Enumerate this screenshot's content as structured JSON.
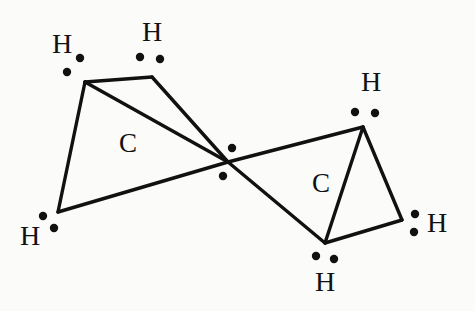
{
  "figure": {
    "background_color": "#fbfbfa",
    "ink_color": "#111111",
    "molecule_formula": "C2H4"
  },
  "atoms": {
    "carbons": [
      {
        "id": "carbon-left",
        "label": "C",
        "x": 128,
        "y": 146
      },
      {
        "id": "carbon-right",
        "label": "C",
        "x": 321,
        "y": 186
      }
    ],
    "hydrogens": [
      {
        "id": "hydrogen-top-left",
        "label": "H",
        "x": 62,
        "y": 47
      },
      {
        "id": "hydrogen-top-middle",
        "label": "H",
        "x": 152,
        "y": 35
      },
      {
        "id": "hydrogen-bottom-left",
        "label": "H",
        "x": 30,
        "y": 239
      },
      {
        "id": "hydrogen-top-right",
        "label": "H",
        "x": 371,
        "y": 85
      },
      {
        "id": "hydrogen-right",
        "label": "H",
        "x": 437,
        "y": 226
      },
      {
        "id": "hydrogen-bottom-middle",
        "label": "H",
        "x": 325,
        "y": 285
      }
    ]
  },
  "vertices": {
    "top_left": {
      "x": 85,
      "y": 82
    },
    "top_middle": {
      "x": 152,
      "y": 77
    },
    "bottom_left": {
      "x": 58,
      "y": 212
    },
    "center": {
      "x": 228,
      "y": 162
    },
    "top_right": {
      "x": 363,
      "y": 127
    },
    "right": {
      "x": 402,
      "y": 220
    },
    "bottom_middle": {
      "x": 325,
      "y": 243
    }
  },
  "bonds": [
    {
      "id": "bond-topleft-topmiddle",
      "from": "top_left",
      "to": "top_middle"
    },
    {
      "id": "bond-topleft-bottomleft",
      "from": "top_left",
      "to": "bottom_left"
    },
    {
      "id": "bond-topleft-center",
      "from": "top_left",
      "to": "center"
    },
    {
      "id": "bond-topmiddle-center",
      "from": "top_middle",
      "to": "center"
    },
    {
      "id": "bond-bottomleft-center",
      "from": "bottom_left",
      "to": "center"
    },
    {
      "id": "bond-center-topright",
      "from": "center",
      "to": "top_right"
    },
    {
      "id": "bond-center-bottommiddle",
      "from": "center",
      "to": "bottom_middle"
    },
    {
      "id": "bond-topright-right",
      "from": "top_right",
      "to": "right"
    },
    {
      "id": "bond-topright-bottommiddle",
      "from": "top_right",
      "to": "bottom_middle"
    },
    {
      "id": "bond-right-bottommiddle",
      "from": "right",
      "to": "bottom_middle"
    }
  ],
  "electron_dots": [
    {
      "id": "dot-center-upper",
      "x": 232,
      "y": 148,
      "r": 4.2,
      "group": "double-bond-pair"
    },
    {
      "id": "dot-center-lower",
      "x": 223,
      "y": 176,
      "r": 4.2,
      "group": "double-bond-pair"
    },
    {
      "id": "dot-topleft-a",
      "x": 80,
      "y": 58,
      "r": 4.2,
      "group": "hydrogen-top-left"
    },
    {
      "id": "dot-topleft-b",
      "x": 67,
      "y": 72,
      "r": 4.2,
      "group": "hydrogen-top-left"
    },
    {
      "id": "dot-topmiddle-a",
      "x": 140,
      "y": 57,
      "r": 4.2,
      "group": "hydrogen-top-middle"
    },
    {
      "id": "dot-topmiddle-b",
      "x": 160,
      "y": 59,
      "r": 4.2,
      "group": "hydrogen-top-middle"
    },
    {
      "id": "dot-bottomleft-a",
      "x": 43,
      "y": 216,
      "r": 4.2,
      "group": "hydrogen-bottom-left"
    },
    {
      "id": "dot-bottomleft-b",
      "x": 54,
      "y": 228,
      "r": 4.2,
      "group": "hydrogen-bottom-left"
    },
    {
      "id": "dot-topright-a",
      "x": 355,
      "y": 112,
      "r": 4.2,
      "group": "hydrogen-top-right"
    },
    {
      "id": "dot-topright-b",
      "x": 375,
      "y": 113,
      "r": 4.2,
      "group": "hydrogen-top-right"
    },
    {
      "id": "dot-right-a",
      "x": 415,
      "y": 214,
      "r": 4.2,
      "group": "hydrogen-right"
    },
    {
      "id": "dot-right-b",
      "x": 414,
      "y": 232,
      "r": 4.2,
      "group": "hydrogen-right"
    },
    {
      "id": "dot-bottommiddle-a",
      "x": 316,
      "y": 256,
      "r": 4.2,
      "group": "hydrogen-bottom-middle"
    },
    {
      "id": "dot-bottommiddle-b",
      "x": 334,
      "y": 259,
      "r": 4.2,
      "group": "hydrogen-bottom-middle"
    }
  ]
}
